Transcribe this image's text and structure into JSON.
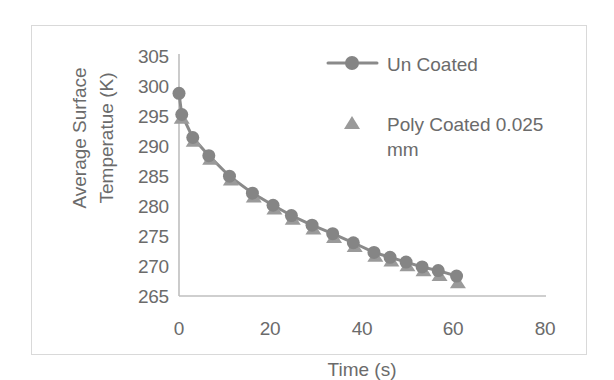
{
  "chart_data": {
    "type": "line",
    "title": "",
    "xlabel": "Time (s)",
    "ylabel": "Average Surface\nTemperatue (K)",
    "xlim": [
      0,
      80
    ],
    "ylim": [
      265,
      305
    ],
    "xticks": [
      0,
      20,
      40,
      60,
      80
    ],
    "yticks": [
      265,
      270,
      275,
      280,
      285,
      290,
      295,
      300,
      305
    ],
    "grid": false,
    "legend_position": "upper-right-inside",
    "series": [
      {
        "name": "Un Coated",
        "marker": "circle",
        "line": true,
        "color": "#808080",
        "x": [
          0,
          0.6,
          3,
          6.5,
          11,
          16,
          20.5,
          24.5,
          29,
          33.5,
          38,
          42.5,
          46,
          49.5,
          53,
          56.5,
          60.5
        ],
        "y": [
          298.5,
          295.0,
          291.2,
          288.2,
          284.8,
          282.0,
          280.0,
          278.3,
          276.7,
          275.3,
          273.8,
          272.2,
          271.4,
          270.6,
          269.8,
          269.2,
          268.3
        ]
      },
      {
        "name": "Poly Coated 0.025\nmm",
        "marker": "triangle",
        "line": false,
        "color": "#909090",
        "x": [
          0.6,
          3.2,
          6.8,
          11.3,
          16.3,
          20.8,
          24.8,
          29.3,
          33.8,
          38.3,
          42.8,
          46.3,
          49.8,
          53.3,
          56.8,
          60.8
        ],
        "y": [
          294.4,
          290.6,
          287.6,
          284.2,
          281.4,
          279.4,
          277.7,
          276.1,
          274.7,
          273.2,
          271.6,
          270.8,
          270.0,
          269.2,
          268.4,
          267.2
        ]
      }
    ]
  },
  "axes": {
    "y_tick_labels": [
      "305",
      "300",
      "295",
      "290",
      "285",
      "280",
      "275",
      "270",
      "265"
    ],
    "x_tick_labels": [
      "0",
      "20",
      "40",
      "60",
      "80"
    ],
    "y_title": "Average Surface\nTemperatue (K)",
    "x_title": "Time (s)"
  },
  "legend": {
    "entries": [
      {
        "label": "Un Coated",
        "marker": "circle-with-line"
      },
      {
        "label": "Poly Coated 0.025\nmm",
        "marker": "triangle"
      }
    ]
  },
  "colors": {
    "series_gray": "#808080",
    "axis_line": "#bfbfbf",
    "text_gray": "#6b6b6b",
    "frame_border": "#d9d9d9",
    "background": "#ffffff"
  }
}
